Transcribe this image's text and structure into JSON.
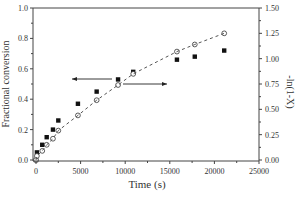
{
  "chart_data": {
    "type": "scatter",
    "title": "",
    "xlabel": "Time (s)",
    "ylabel": "Fractional conversion",
    "y2label": "-ln(1-X)",
    "xlim": [
      0,
      25000
    ],
    "ylim": [
      0.0,
      1.0
    ],
    "y2lim": [
      0.0,
      1.5
    ],
    "xticks": [
      0,
      5000,
      10000,
      15000,
      20000,
      25000
    ],
    "yticks": [
      0.0,
      0.2,
      0.4,
      0.6,
      0.8,
      1.0
    ],
    "y2ticks": [
      0.0,
      0.25,
      0.5,
      0.75,
      1.0,
      1.25,
      1.5
    ],
    "grid": false,
    "legend": "none",
    "annotations": [
      {
        "type": "arrow",
        "direction": "left",
        "meaning": "squares refer to left axis (Fractional conversion)"
      },
      {
        "type": "arrow",
        "direction": "right",
        "meaning": "circles refer to right axis (-ln(1-X))"
      }
    ],
    "series": [
      {
        "name": "Fractional conversion",
        "axis": "left",
        "marker": "filled-square",
        "x": [
          0,
          100,
          700,
          1200,
          1900,
          2500,
          4700,
          6800,
          9200,
          10900,
          15800,
          17800,
          21100
        ],
        "y": [
          0.0,
          0.05,
          0.1,
          0.15,
          0.2,
          0.26,
          0.37,
          0.45,
          0.53,
          0.58,
          0.66,
          0.68,
          0.72
        ]
      },
      {
        "name": "-ln(1-X)",
        "axis": "right",
        "marker": "open-circle",
        "x": [
          0,
          100,
          700,
          1200,
          1900,
          2500,
          4700,
          6800,
          9200,
          10900,
          15800,
          17800,
          21100
        ],
        "y": [
          0.0,
          0.04,
          0.09,
          0.15,
          0.21,
          0.29,
          0.44,
          0.59,
          0.74,
          0.85,
          1.07,
          1.14,
          1.25
        ]
      },
      {
        "name": "fit",
        "axis": "right",
        "style": "dashed-line",
        "x": [
          0,
          21100
        ],
        "y": [
          0.0,
          1.25
        ]
      }
    ]
  }
}
